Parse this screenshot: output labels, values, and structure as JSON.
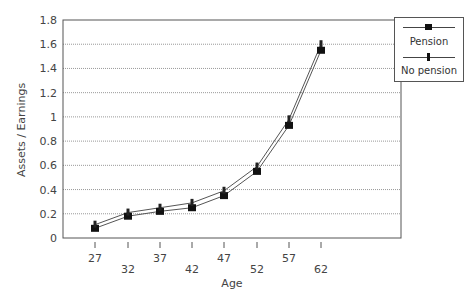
{
  "chart_data": {
    "type": "line",
    "title": "",
    "xlabel": "Age",
    "ylabel": "Assets / Earnings",
    "x": [
      27,
      32,
      37,
      42,
      47,
      52,
      57,
      62
    ],
    "series": [
      {
        "name": "Pension",
        "marker": "square",
        "values": [
          0.08,
          0.18,
          0.22,
          0.25,
          0.35,
          0.55,
          0.93,
          1.55
        ]
      },
      {
        "name": "No pension",
        "marker": "small-diamond",
        "values": [
          0.11,
          0.21,
          0.25,
          0.29,
          0.39,
          0.59,
          0.98,
          1.6
        ]
      }
    ],
    "yticks": [
      "0",
      "0.2",
      "0.4",
      "0.6",
      "0.8",
      "1",
      "1.2",
      "1.4",
      "1.6",
      "1.8"
    ],
    "xticks": [
      "27",
      "32",
      "37",
      "42",
      "47",
      "52",
      "57",
      "62"
    ],
    "ylim": [
      0,
      1.8
    ],
    "grid": "horizontal dotted",
    "legend_position": "right"
  },
  "legend": {
    "pension": "Pension",
    "no_pension": "No pension"
  },
  "axes": {
    "xlabel": "Age",
    "ylabel": "Assets / Earnings"
  }
}
